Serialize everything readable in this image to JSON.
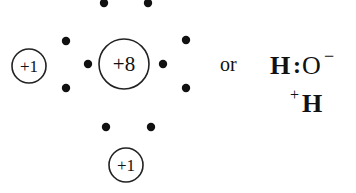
{
  "diagram": {
    "type": "electron-dot-structure",
    "molecule": "hydroxide-ion-with-proton (H3O+ formation)",
    "nuclei": [
      {
        "id": "left-hydrogen",
        "label": "+1",
        "cx": 29,
        "cy": 66,
        "r": 17
      },
      {
        "id": "oxygen",
        "label": "+8",
        "cx": 124,
        "cy": 64,
        "r": 25
      },
      {
        "id": "bottom-hydrogen",
        "label": "+1",
        "cx": 126,
        "cy": 165,
        "r": 17
      }
    ],
    "electrons": [
      {
        "cx": 104,
        "cy": 3
      },
      {
        "cx": 148,
        "cy": 3
      },
      {
        "cx": 66,
        "cy": 41
      },
      {
        "cx": 66,
        "cy": 88
      },
      {
        "cx": 88,
        "cy": 64
      },
      {
        "cx": 163,
        "cy": 64
      },
      {
        "cx": 186,
        "cy": 40
      },
      {
        "cx": 186,
        "cy": 88
      },
      {
        "cx": 106,
        "cy": 127
      },
      {
        "cx": 151,
        "cy": 127
      }
    ],
    "connector_text": "or",
    "formula": {
      "line1": {
        "h": "H",
        "colon": ":",
        "o": "O",
        "charge": "−"
      },
      "line2": {
        "charge": "+",
        "h": "H"
      }
    }
  }
}
